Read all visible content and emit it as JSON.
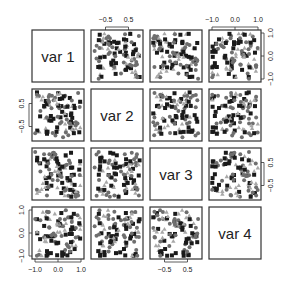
{
  "chart_data": {
    "type": "scatter",
    "subtype": "scatterplot-matrix",
    "title": "",
    "variables": [
      "var 1",
      "var 2",
      "var 3",
      "var 4"
    ],
    "variable_ranges": {
      "var 1": [
        -1.0,
        1.0
      ],
      "var 2": [
        -1.0,
        1.0
      ],
      "var 3": [
        -1.0,
        1.0
      ],
      "var 4": [
        -1.0,
        1.0
      ]
    },
    "axes": {
      "top": [
        {
          "column": 2,
          "ticks": [
            -0.5,
            0.5
          ],
          "labels": [
            "-0.5",
            "0.5"
          ]
        },
        {
          "column": 4,
          "ticks": [
            -1.0,
            0.0,
            1.0
          ],
          "labels": [
            "-1.0",
            "0.0",
            "1.0"
          ]
        }
      ],
      "right": [
        {
          "row": 1,
          "ticks": [
            -1.0,
            0.0,
            1.0
          ],
          "labels": [
            "-1.0",
            "0.0",
            "1.0"
          ]
        },
        {
          "row": 3,
          "ticks": [
            -0.5,
            0.5
          ],
          "labels": [
            "-0.5",
            "0.5"
          ]
        }
      ],
      "left": [
        {
          "row": 2,
          "ticks": [
            -0.5,
            0.5
          ],
          "labels": [
            "-0.5",
            "0.5"
          ]
        },
        {
          "row": 4,
          "ticks": [
            -1.0,
            0.0,
            1.0
          ],
          "labels": [
            "-1.0",
            "0.0",
            "1.0"
          ]
        }
      ],
      "bottom": [
        {
          "column": 1,
          "ticks": [
            -1.0,
            0.0,
            1.0
          ],
          "labels": [
            "-1.0",
            "0.0",
            "1.0"
          ]
        },
        {
          "column": 3,
          "ticks": [
            -0.5,
            0.5
          ],
          "labels": [
            "-0.5",
            "0.5"
          ]
        }
      ]
    },
    "groups": [
      {
        "name": "group 1",
        "marker": "square",
        "color": "#1a1a1a"
      },
      {
        "name": "group 2",
        "marker": "circle",
        "color": "#6e6e6e"
      },
      {
        "name": "group 3",
        "marker": "triangle",
        "color": "#a8a8a8"
      }
    ],
    "n_points_per_panel": 100,
    "distribution": "approximately uniform, no visible correlation between any pair",
    "grid": false,
    "legend": "none"
  },
  "layout": {
    "panel_origin_x": [
      32,
      91,
      150,
      209
    ],
    "panel_origin_y": [
      30,
      89,
      148,
      207
    ],
    "panel_size": 52
  }
}
